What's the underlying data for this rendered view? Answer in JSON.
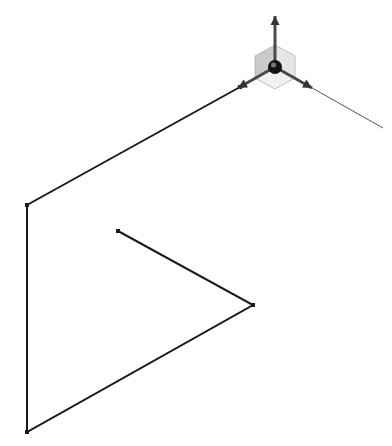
{
  "viewport": {
    "width": 392,
    "height": 446,
    "background": "#ffffff"
  },
  "sketch": {
    "stroke_color": "#1a1a1a",
    "stroke_width": 2,
    "vertices": [
      {
        "id": "v1",
        "x": 240,
        "y": 87
      },
      {
        "id": "v2",
        "x": 27,
        "y": 205
      },
      {
        "id": "v3",
        "x": 27,
        "y": 432
      },
      {
        "id": "v4",
        "x": 253,
        "y": 305
      },
      {
        "id": "v5",
        "x": 118,
        "y": 231
      }
    ]
  },
  "triad": {
    "origin": {
      "x": 275,
      "y": 67
    },
    "axis_color": "#4a4a4a",
    "plane_fill": "#bdbdbd",
    "plane_fill_light": "#e2e2e2",
    "center_color": "#111111",
    "axes": [
      {
        "name": "y-axis",
        "tip": {
          "x": 275,
          "y": 16
        }
      },
      {
        "name": "x-axis",
        "tip": {
          "x": 238,
          "y": 88
        }
      },
      {
        "name": "z-axis",
        "tip": {
          "x": 312,
          "y": 88
        }
      }
    ],
    "extension_line": {
      "to": {
        "x": 383,
        "y": 128
      },
      "color": "#555555"
    }
  }
}
